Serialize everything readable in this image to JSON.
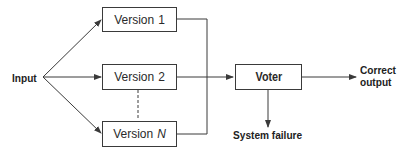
{
  "diagram": {
    "type": "N-version programming",
    "input_label": "Input",
    "versions": [
      {
        "label": "Version",
        "suffix": "1",
        "suffix_italic": false
      },
      {
        "label": "Version",
        "suffix": "2",
        "suffix_italic": false
      },
      {
        "label": "Version",
        "suffix": "N",
        "suffix_italic": true
      }
    ],
    "voter_label": "Voter",
    "output_label_line1": "Correct",
    "output_label_line2": "output",
    "failure_label": "System failure",
    "colors": {
      "line": "#3a3a3a",
      "text": "#222222",
      "background": "#ffffff"
    }
  }
}
